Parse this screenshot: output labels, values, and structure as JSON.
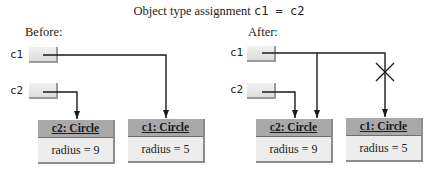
{
  "title": {
    "prefix": "Object type assignment ",
    "code": "c1 = c2"
  },
  "before": {
    "label": "Before:",
    "vars": [
      {
        "name": "c1",
        "points_to": "c1: Circle"
      },
      {
        "name": "c2",
        "points_to": "c2: Circle"
      }
    ],
    "objects": [
      {
        "name": "c2: Circle",
        "field": "radius = 9"
      },
      {
        "name": "c1: Circle",
        "field": "radius = 5"
      }
    ]
  },
  "after": {
    "label": "After:",
    "vars": [
      {
        "name": "c1",
        "points_to": "c2: Circle"
      },
      {
        "name": "c2",
        "points_to": "c2: Circle"
      }
    ],
    "objects": [
      {
        "name": "c2: Circle",
        "field": "radius = 9"
      },
      {
        "name": "c1: Circle",
        "field": "radius = 5"
      }
    ],
    "broken_reference": "c1 -> c1: Circle"
  },
  "colors": {
    "line": "#1a1a1a",
    "object_header": "#a9a9a9",
    "object_body": "#ededed",
    "ref_box": "#e6e6e6"
  }
}
